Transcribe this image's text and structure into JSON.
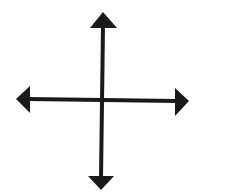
{
  "figure": {
    "icon": "four-way-arrow-icon",
    "colors": {
      "stroke": "#1a1a1a",
      "fill": "#1a1a1a",
      "background": "#ffffff"
    }
  }
}
